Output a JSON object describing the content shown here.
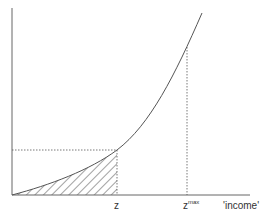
{
  "diagram": {
    "x_axis_label": "'income'",
    "ticks": {
      "z": "z",
      "zmax_base": "z",
      "zmax_sup": "max"
    },
    "curve": "convex increasing curve from origin",
    "shaded_region": "hatched area under curve from 0 to z",
    "colors": {
      "line": "#555555",
      "background": "#ffffff"
    }
  }
}
